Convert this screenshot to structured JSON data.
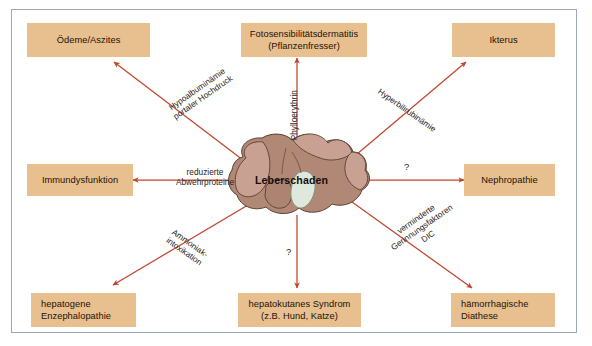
{
  "figure": {
    "center": {
      "label": "Leberschaden",
      "illustration": "liver-illustration"
    },
    "nodes": [
      {
        "id": "oedeme",
        "lines": [
          "Ödeme/Aszites"
        ]
      },
      {
        "id": "fotosens",
        "lines": [
          "Fotosensibilitätsdermatitis",
          "(Pflanzenfresser)"
        ]
      },
      {
        "id": "ikterus",
        "lines": [
          "Ikterus"
        ]
      },
      {
        "id": "immun",
        "lines": [
          "Immundysfunktion"
        ]
      },
      {
        "id": "nephro",
        "lines": [
          "Nephropathie"
        ]
      },
      {
        "id": "enzephalo",
        "lines": [
          "hepatogene",
          "Enzephalopathie"
        ]
      },
      {
        "id": "hepatokutan",
        "lines": [
          "hepatokutanes Syndrom",
          "(z.B. Hund, Katze)"
        ]
      },
      {
        "id": "diathese",
        "lines": [
          "hämorrhagische",
          "Diathese"
        ]
      }
    ],
    "edges": [
      {
        "id": "to-oedeme",
        "lines": [
          "Hypoalbuminämie",
          "portaler Hochdruck"
        ]
      },
      {
        "id": "to-fotosens",
        "lines": [
          "Phylloerythrin"
        ]
      },
      {
        "id": "to-ikterus",
        "lines": [
          "Hyperbilirubinämie"
        ]
      },
      {
        "id": "to-immun",
        "lines": [
          "reduzierte",
          "Abwehrproteine"
        ]
      },
      {
        "id": "to-nephro",
        "lines": [
          "?"
        ]
      },
      {
        "id": "to-enzephalo",
        "lines": [
          "Ammoniak-",
          "intoxikation"
        ]
      },
      {
        "id": "to-hepatokutan",
        "lines": [
          "?"
        ]
      },
      {
        "id": "to-diathese",
        "lines": [
          "verminderte",
          "Gerinnungsfaktoren",
          "DIC"
        ]
      }
    ],
    "colors": {
      "node_fill": "#e8bf8e",
      "arrow": "#c0452c",
      "frame_border": "#9aa8bd",
      "background": "#ffffff",
      "liver_body": "#b08875",
      "liver_lobe": "#c9a192",
      "gallbladder": "#dfe8dc"
    }
  }
}
